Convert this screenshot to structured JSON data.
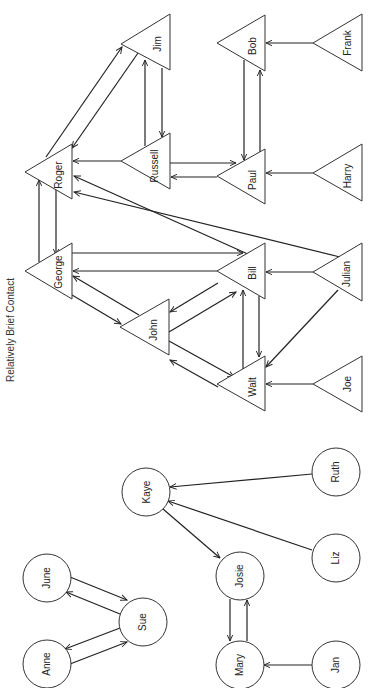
{
  "caption": "Relatively Brief Contact",
  "groups": [
    {
      "name": "male-network",
      "shape": "triangle",
      "nodes": [
        {
          "id": "jim",
          "label": "Jim",
          "x": 121,
          "y": 42
        },
        {
          "id": "russell",
          "label": "Russell",
          "x": 121,
          "y": 161
        },
        {
          "id": "roger",
          "label": "Roger",
          "x": 25,
          "y": 172
        },
        {
          "id": "bob",
          "label": "Bob",
          "x": 217,
          "y": 43
        },
        {
          "id": "frank",
          "label": "Frank",
          "x": 313,
          "y": 43
        },
        {
          "id": "paul",
          "label": "Paul",
          "x": 217,
          "y": 176
        },
        {
          "id": "harry",
          "label": "Harry",
          "x": 313,
          "y": 173
        },
        {
          "id": "george",
          "label": "George",
          "x": 25,
          "y": 271
        },
        {
          "id": "john",
          "label": "John",
          "x": 120,
          "y": 327
        },
        {
          "id": "bill",
          "label": "Bill",
          "x": 217,
          "y": 271
        },
        {
          "id": "julian",
          "label": "Julian",
          "x": 313,
          "y": 272
        },
        {
          "id": "walt",
          "label": "Walt",
          "x": 217,
          "y": 384
        },
        {
          "id": "joe",
          "label": "Joe",
          "x": 313,
          "y": 384
        }
      ]
    },
    {
      "name": "female-network",
      "shape": "circle",
      "nodes": [
        {
          "id": "kaye",
          "label": "Kaye",
          "x": 146,
          "y": 492
        },
        {
          "id": "june",
          "label": "June",
          "x": 47,
          "y": 578
        },
        {
          "id": "sue",
          "label": "Sue",
          "x": 143,
          "y": 622
        },
        {
          "id": "anne",
          "label": "Anne",
          "x": 47,
          "y": 659
        },
        {
          "id": "josie",
          "label": "Josie",
          "x": 240,
          "y": 576
        },
        {
          "id": "mary",
          "label": "Mary",
          "x": 240,
          "y": 663
        },
        {
          "id": "ruth",
          "label": "Ruth",
          "x": 336,
          "y": 472
        },
        {
          "id": "liz",
          "label": "Liz",
          "x": 336,
          "y": 558
        },
        {
          "id": "jan",
          "label": "Jan",
          "x": 336,
          "y": 664
        }
      ]
    }
  ],
  "edges": [
    {
      "from": "roger",
      "to": "jim"
    },
    {
      "from": "jim",
      "to": "roger"
    },
    {
      "from": "russell",
      "to": "jim"
    },
    {
      "from": "jim",
      "to": "russell"
    },
    {
      "from": "russell",
      "to": "roger"
    },
    {
      "from": "russell",
      "to": "paul"
    },
    {
      "from": "paul",
      "to": "russell"
    },
    {
      "from": "bob",
      "to": "paul"
    },
    {
      "from": "paul",
      "to": "bob"
    },
    {
      "from": "frank",
      "to": "bob"
    },
    {
      "from": "harry",
      "to": "paul"
    },
    {
      "from": "roger",
      "to": "george"
    },
    {
      "from": "george",
      "to": "roger"
    },
    {
      "from": "bill",
      "to": "roger"
    },
    {
      "from": "julian",
      "to": "roger"
    },
    {
      "from": "george",
      "to": "bill"
    },
    {
      "from": "bill",
      "to": "george"
    },
    {
      "from": "george",
      "to": "john"
    },
    {
      "from": "john",
      "to": "george"
    },
    {
      "from": "bill",
      "to": "john"
    },
    {
      "from": "john",
      "to": "bill"
    },
    {
      "from": "john",
      "to": "walt"
    },
    {
      "from": "walt",
      "to": "john"
    },
    {
      "from": "bill",
      "to": "walt"
    },
    {
      "from": "walt",
      "to": "bill"
    },
    {
      "from": "julian",
      "to": "bill"
    },
    {
      "from": "julian",
      "to": "walt"
    },
    {
      "from": "joe",
      "to": "walt"
    },
    {
      "from": "june",
      "to": "sue"
    },
    {
      "from": "sue",
      "to": "june"
    },
    {
      "from": "sue",
      "to": "anne"
    },
    {
      "from": "anne",
      "to": "sue"
    },
    {
      "from": "ruth",
      "to": "kaye"
    },
    {
      "from": "liz",
      "to": "kaye"
    },
    {
      "from": "kaye",
      "to": "josie"
    },
    {
      "from": "josie",
      "to": "mary"
    },
    {
      "from": "mary",
      "to": "josie"
    },
    {
      "from": "jan",
      "to": "mary"
    }
  ]
}
